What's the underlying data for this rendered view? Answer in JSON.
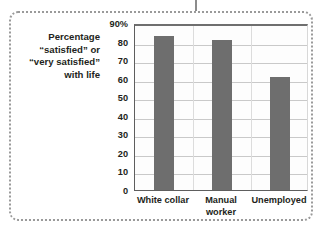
{
  "figure": {
    "caption_lines": [
      "Percentage",
      "“satisfied” or",
      "“very satisfied”",
      "with life"
    ],
    "frame_style": "dotted",
    "accent_color": "#6e6e6e",
    "grid_color": "#c9c9c9",
    "text_color": "#231f20"
  },
  "chart_data": {
    "type": "bar",
    "title": "",
    "subtitle": "",
    "xlabel": "",
    "ylabel": "Percentage “satisfied” or “very satisfied” with life",
    "categories": [
      "White collar",
      "Manual worker",
      "Unemployed"
    ],
    "category_lines": [
      [
        "White collar"
      ],
      [
        "Manual",
        "worker"
      ],
      [
        "Unemployed"
      ]
    ],
    "values": [
      83,
      81,
      61
    ],
    "ylim": [
      0,
      90
    ],
    "ytick_values": [
      0,
      10,
      20,
      30,
      40,
      50,
      60,
      70,
      80,
      90
    ],
    "ytick_labels": [
      "0",
      "10",
      "20",
      "30",
      "40",
      "50",
      "60",
      "70",
      "80",
      "90%"
    ],
    "grid": true,
    "legend": false,
    "legend_position": "none",
    "bar_color": "#6e6e6e"
  }
}
